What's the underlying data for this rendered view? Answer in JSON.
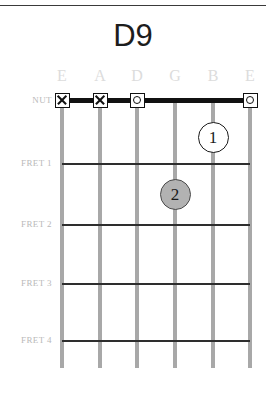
{
  "chord": {
    "name": "D9"
  },
  "layout": {
    "board_left": 62,
    "board_right": 250,
    "string_spacing": 37.6,
    "nut_y": 100,
    "string_bottom": 368,
    "dot_diameter": 31
  },
  "strings": [
    {
      "index": 0,
      "label": "E",
      "x": 62,
      "note": "low-e"
    },
    {
      "index": 1,
      "label": "A",
      "x": 100,
      "note": "a"
    },
    {
      "index": 2,
      "label": "D",
      "x": 137,
      "note": "d"
    },
    {
      "index": 3,
      "label": "G",
      "x": 175,
      "note": "g"
    },
    {
      "index": 4,
      "label": "B",
      "x": 213,
      "note": "b"
    },
    {
      "index": 5,
      "label": "E",
      "x": 250,
      "note": "high-e"
    }
  ],
  "frets": [
    {
      "label": "NUT",
      "y": 100,
      "is_nut": true
    },
    {
      "label": "FRET 1",
      "y": 163,
      "is_nut": false
    },
    {
      "label": "FRET 2",
      "y": 224,
      "is_nut": false
    },
    {
      "label": "FRET 3",
      "y": 283,
      "is_nut": false
    },
    {
      "label": "FRET 4",
      "y": 340,
      "is_nut": false
    }
  ],
  "nut_markers": [
    {
      "string_index": 0,
      "x": 62,
      "type": "mute",
      "symbol": "X"
    },
    {
      "string_index": 1,
      "x": 100,
      "type": "mute",
      "symbol": "X"
    },
    {
      "string_index": 2,
      "x": 137,
      "type": "open",
      "symbol": "O"
    },
    {
      "string_index": 5,
      "x": 250,
      "type": "open",
      "symbol": "O"
    }
  ],
  "finger_dots": [
    {
      "finger": "1",
      "string_index": 4,
      "string_label": "B",
      "fret": 1,
      "x": 213,
      "y": 137,
      "style": "open"
    },
    {
      "finger": "2",
      "string_index": 3,
      "string_label": "G",
      "fret": 2,
      "x": 175,
      "y": 194,
      "style": "filled"
    }
  ],
  "colors": {
    "background": "#ffffff",
    "title": "#1d1d1d",
    "string": "#a8a8a8",
    "fret_line": "#2e2e2e",
    "nut_line": "#111111",
    "label_faint": "#dcdcdc",
    "fret_label": "#b9b9b9",
    "dot_filled": "#b2b2b2",
    "dot_open": "#ffffff"
  }
}
